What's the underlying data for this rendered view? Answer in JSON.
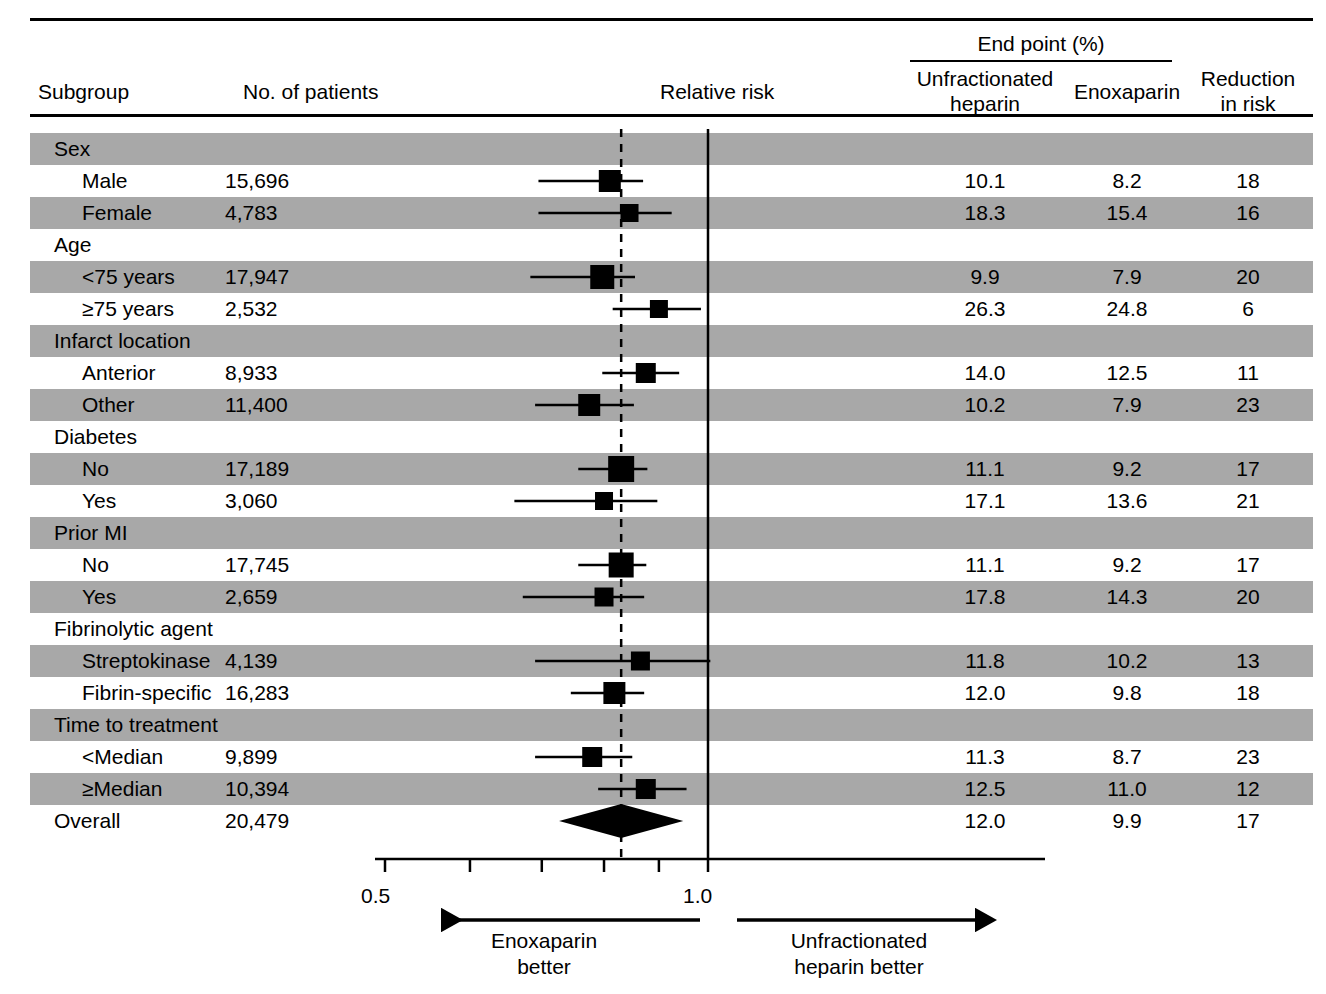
{
  "header": {
    "subgroup": "Subgroup",
    "no_of_patients": "No. of patients",
    "relative_risk": "Relative risk",
    "end_point": "End point (%)",
    "unfractionated_line1": "Unfractionated",
    "unfractionated_line2": "heparin",
    "enoxaparin": "Enoxaparin",
    "reduction_line1": "Reduction",
    "reduction_line2": "in risk"
  },
  "footer": {
    "left_line1": "Enoxaparin",
    "left_line2": "better",
    "right_line1": "Unfractionated",
    "right_line2": "heparin better",
    "left_arrow_icon": "left-arrow-icon",
    "right_arrow_icon": "right-arrow-icon"
  },
  "colors": {
    "band": "#a8a8a8",
    "ink": "#000000",
    "background": "#ffffff"
  },
  "chart_data": {
    "type": "forest",
    "title": "",
    "xlabel": "Relative risk",
    "xscale": "log",
    "xlim": [
      0.5,
      1.05
    ],
    "xticks": [
      0.5,
      0.6,
      0.7,
      0.8,
      0.9,
      1.0
    ],
    "xtick_labels": [
      "0.5",
      "",
      "",
      "",
      "",
      "1.0"
    ],
    "reference_line": 1.0,
    "overall_line": 0.83,
    "grid": false,
    "legend": "none",
    "columns": [
      "Subgroup",
      "No. of patients",
      "Relative risk",
      "Unfractionated heparin",
      "Enoxaparin",
      "Reduction in risk"
    ],
    "rows": [
      {
        "type": "group",
        "label": "Sex",
        "band": true,
        "n": "",
        "ufh": "",
        "enox": "",
        "reduction": ""
      },
      {
        "type": "item",
        "label": "Male",
        "band": false,
        "n": "15,696",
        "ufh": "10.1",
        "enox": "8.2",
        "reduction": "18",
        "rr": 0.81,
        "ci_low": 0.695,
        "ci_high": 0.87,
        "box": 22
      },
      {
        "type": "item",
        "label": "Female",
        "band": true,
        "n": "4,783",
        "ufh": "18.3",
        "enox": "15.4",
        "reduction": "16",
        "rr": 0.845,
        "ci_low": 0.695,
        "ci_high": 0.925,
        "box": 18
      },
      {
        "type": "group",
        "label": "Age",
        "band": false,
        "n": "",
        "ufh": "",
        "enox": "",
        "reduction": ""
      },
      {
        "type": "item",
        "label": "<75 years",
        "band": true,
        "n": "17,947",
        "ufh": "9.9",
        "enox": "7.9",
        "reduction": "20",
        "rr": 0.797,
        "ci_low": 0.683,
        "ci_high": 0.855,
        "box": 24
      },
      {
        "type": "item",
        "label": "≥75 years",
        "band": false,
        "n": "2,532",
        "ufh": "26.3",
        "enox": "24.8",
        "reduction": "6",
        "rr": 0.9,
        "ci_low": 0.815,
        "ci_high": 0.985,
        "box": 18
      },
      {
        "type": "group",
        "label": "Infarct location",
        "band": true,
        "n": "",
        "ufh": "",
        "enox": "",
        "reduction": ""
      },
      {
        "type": "item",
        "label": "Anterior",
        "band": false,
        "n": "8,933",
        "ufh": "14.0",
        "enox": "12.5",
        "reduction": "11",
        "rr": 0.875,
        "ci_low": 0.797,
        "ci_high": 0.94,
        "box": 20
      },
      {
        "type": "item",
        "label": "Other",
        "band": true,
        "n": "11,400",
        "ufh": "10.2",
        "enox": "7.9",
        "reduction": "23",
        "rr": 0.775,
        "ci_low": 0.69,
        "ci_high": 0.853,
        "box": 22
      },
      {
        "type": "group",
        "label": "Diabetes",
        "band": false,
        "n": "",
        "ufh": "",
        "enox": "",
        "reduction": ""
      },
      {
        "type": "item",
        "label": "No",
        "band": true,
        "n": "17,189",
        "ufh": "11.1",
        "enox": "9.2",
        "reduction": "17",
        "rr": 0.83,
        "ci_low": 0.757,
        "ci_high": 0.878,
        "box": 26
      },
      {
        "type": "item",
        "label": "Yes",
        "band": false,
        "n": "3,060",
        "ufh": "17.1",
        "enox": "13.6",
        "reduction": "21",
        "rr": 0.8,
        "ci_low": 0.66,
        "ci_high": 0.897,
        "box": 18
      },
      {
        "type": "group",
        "label": "Prior MI",
        "band": true,
        "n": "",
        "ufh": "",
        "enox": "",
        "reduction": ""
      },
      {
        "type": "item",
        "label": "No",
        "band": false,
        "n": "17,745",
        "ufh": "11.1",
        "enox": "9.2",
        "reduction": "17",
        "rr": 0.83,
        "ci_low": 0.757,
        "ci_high": 0.876,
        "box": 25
      },
      {
        "type": "item",
        "label": "Yes",
        "band": true,
        "n": "2,659",
        "ufh": "17.8",
        "enox": "14.3",
        "reduction": "20",
        "rr": 0.8,
        "ci_low": 0.672,
        "ci_high": 0.872,
        "box": 19
      },
      {
        "type": "group",
        "label": "Fibrinolytic agent",
        "band": false,
        "n": "",
        "ufh": "",
        "enox": "",
        "reduction": ""
      },
      {
        "type": "item",
        "label": "Streptokinase",
        "band": true,
        "n": "4,139",
        "ufh": "11.8",
        "enox": "10.2",
        "reduction": "13",
        "rr": 0.865,
        "ci_low": 0.69,
        "ci_high": 1.005,
        "box": 19
      },
      {
        "type": "item",
        "label": "Fibrin-specific",
        "band": false,
        "n": "16,283",
        "ufh": "12.0",
        "enox": "9.8",
        "reduction": "18",
        "rr": 0.818,
        "ci_low": 0.745,
        "ci_high": 0.872,
        "box": 22
      },
      {
        "type": "group",
        "label": "Time to treatment",
        "band": true,
        "n": "",
        "ufh": "",
        "enox": "",
        "reduction": ""
      },
      {
        "type": "item",
        "label": "<Median",
        "band": false,
        "n": "9,899",
        "ufh": "11.3",
        "enox": "8.7",
        "reduction": "23",
        "rr": 0.78,
        "ci_low": 0.69,
        "ci_high": 0.85,
        "box": 20
      },
      {
        "type": "item",
        "label": "≥Median",
        "band": true,
        "n": "10,394",
        "ufh": "12.5",
        "enox": "11.0",
        "reduction": "12",
        "rr": 0.875,
        "ci_low": 0.79,
        "ci_high": 0.955,
        "box": 20
      },
      {
        "type": "overall",
        "label": "Overall",
        "band": false,
        "n": "20,479",
        "ufh": "12.0",
        "enox": "9.9",
        "reduction": "17",
        "rr": 0.83,
        "ci_low": 0.785,
        "ci_high": 0.878,
        "box": 0
      }
    ]
  }
}
